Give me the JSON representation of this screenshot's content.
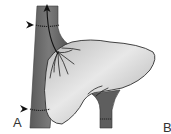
{
  "figure": {
    "labels": {
      "a": "A",
      "b": "B"
    },
    "markers": {
      "arrowheads": [
        "upper-left ligature marker",
        "lower-left ligature marker"
      ],
      "flow_arrow": "upward arrow in vena cava"
    },
    "colors": {
      "vessel": "#6e6e6e",
      "vessel_dark": "#4a4a4a",
      "liver": "#c8c8c8",
      "liver_highlight": "#e6e6e6",
      "outline": "#2a2a2a",
      "background": "#ffffff"
    }
  }
}
